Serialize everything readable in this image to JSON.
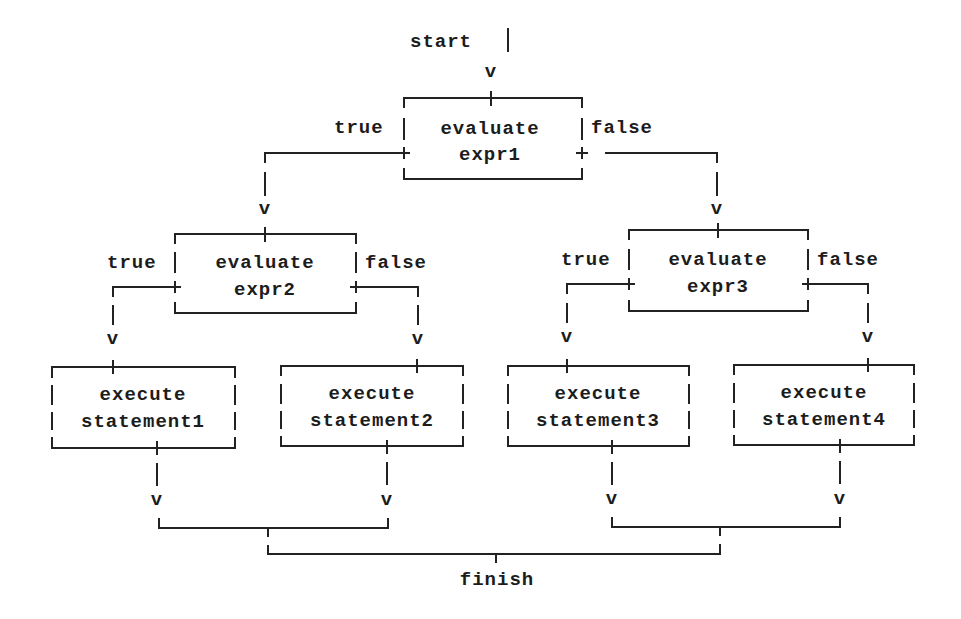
{
  "diagram": {
    "type": "flowchart",
    "title": "",
    "start_label": "start",
    "finish_label": "finish",
    "arrow_glyph": "v",
    "true_label": "true",
    "false_label": "false",
    "decisions": [
      {
        "id": "expr1",
        "line1": "evaluate",
        "line2": "expr1"
      },
      {
        "id": "expr2",
        "line1": "evaluate",
        "line2": "expr2"
      },
      {
        "id": "expr3",
        "line1": "evaluate",
        "line2": "expr3"
      }
    ],
    "actions": [
      {
        "id": "statement1",
        "line1": "execute",
        "line2": "statement1"
      },
      {
        "id": "statement2",
        "line1": "execute",
        "line2": "statement2"
      },
      {
        "id": "statement3",
        "line1": "execute",
        "line2": "statement3"
      },
      {
        "id": "statement4",
        "line1": "execute",
        "line2": "statement4"
      }
    ],
    "edges": [
      {
        "from": "start",
        "to": "expr1"
      },
      {
        "from": "expr1",
        "to": "expr2",
        "label": "true"
      },
      {
        "from": "expr1",
        "to": "expr3",
        "label": "false"
      },
      {
        "from": "expr2",
        "to": "statement1",
        "label": "true"
      },
      {
        "from": "expr2",
        "to": "statement2",
        "label": "false"
      },
      {
        "from": "expr3",
        "to": "statement3",
        "label": "true"
      },
      {
        "from": "expr3",
        "to": "statement4",
        "label": "false"
      },
      {
        "from": "statement1",
        "to": "finish"
      },
      {
        "from": "statement2",
        "to": "finish"
      },
      {
        "from": "statement3",
        "to": "finish"
      },
      {
        "from": "statement4",
        "to": "finish"
      }
    ]
  }
}
